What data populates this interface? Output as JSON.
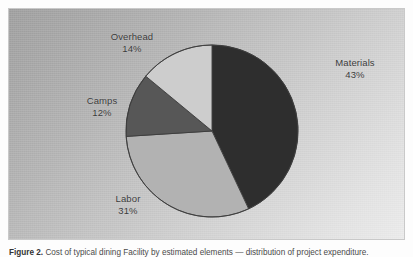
{
  "figure": {
    "caption_label": "Figure 2.",
    "caption_text": "Cost of typical dining Facility by estimated elements — distribution of project expenditure."
  },
  "colors": {
    "frame_border": "#c9c9c9",
    "background_light": "#ebebeb",
    "background_dark": "#9d9d9d",
    "label_text": "#3a3a3a",
    "slice_materials": "#2e2e2e",
    "slice_labor": "#b2b2b2",
    "slice_camps": "#575757",
    "slice_overhead": "#cdcdcd",
    "slice_outline": "#3c3c3c"
  },
  "labels": {
    "overhead": {
      "name": "Overhead",
      "value": "14%"
    },
    "materials": {
      "name": "Materials",
      "value": "43%"
    },
    "camps": {
      "name": "Camps",
      "value": "12%"
    },
    "labor": {
      "name": "Labor",
      "value": "31%"
    }
  },
  "chart_data": {
    "type": "pie",
    "title": "",
    "subtitle": "",
    "xlabel": "",
    "ylabel": "",
    "legend_position": "none",
    "grid": false,
    "label_format": "name + percent, placed outside slices",
    "start_angle_deg": 0,
    "direction": "clockwise",
    "center_px": [
      211,
      130
    ],
    "radius_px": 86,
    "categories": [
      "Materials",
      "Labor",
      "Camps",
      "Overhead"
    ],
    "values": [
      43,
      31,
      12,
      14
    ],
    "units": "percent",
    "total": 100,
    "slices": [
      {
        "label": "Materials",
        "value": 43,
        "display": "43%",
        "color": "#2e2e2e",
        "start_angle_deg": 0.0,
        "end_angle_deg": 154.8
      },
      {
        "label": "Labor",
        "value": 31,
        "display": "31%",
        "color": "#b2b2b2",
        "start_angle_deg": 154.8,
        "end_angle_deg": 266.4
      },
      {
        "label": "Camps",
        "value": 12,
        "display": "12%",
        "color": "#575757",
        "start_angle_deg": 266.4,
        "end_angle_deg": 309.6
      },
      {
        "label": "Overhead",
        "value": 14,
        "display": "14%",
        "color": "#cdcdcd",
        "start_angle_deg": 309.6,
        "end_angle_deg": 360.0
      }
    ]
  }
}
